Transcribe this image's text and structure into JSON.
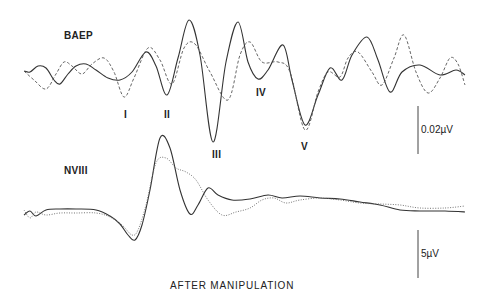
{
  "chart_data": [
    {
      "type": "line",
      "title": "BAEP",
      "xlabel": "",
      "ylabel": "",
      "grid": false,
      "legend": null,
      "scale_bar": "0.02µV",
      "peak_labels": [
        "I",
        "II",
        "III",
        "IV",
        "V"
      ],
      "series": [
        {
          "name": "solid",
          "style": "solid",
          "points": [
            [
              24,
              71
            ],
            [
              30,
              72
            ],
            [
              38,
              66
            ],
            [
              46,
              68
            ],
            [
              54,
              80
            ],
            [
              60,
              84
            ],
            [
              68,
              74
            ],
            [
              76,
              66
            ],
            [
              86,
              64
            ],
            [
              96,
              70
            ],
            [
              108,
              78
            ],
            [
              120,
              80
            ],
            [
              132,
              72
            ],
            [
              146,
              52
            ],
            [
              156,
              66
            ],
            [
              167,
              95
            ],
            [
              178,
              58
            ],
            [
              189,
              20
            ],
            [
              200,
              55
            ],
            [
              213,
              142
            ],
            [
              226,
              62
            ],
            [
              238,
              22
            ],
            [
              248,
              62
            ],
            [
              258,
              79
            ],
            [
              268,
              70
            ],
            [
              283,
              45
            ],
            [
              292,
              80
            ],
            [
              305,
              125
            ],
            [
              318,
              95
            ],
            [
              330,
              68
            ],
            [
              342,
              80
            ],
            [
              352,
              55
            ],
            [
              367,
              37
            ],
            [
              378,
              60
            ],
            [
              390,
              92
            ],
            [
              402,
              72
            ],
            [
              420,
              65
            ],
            [
              440,
              75
            ],
            [
              456,
              70
            ],
            [
              465,
              75
            ]
          ]
        },
        {
          "name": "dashed",
          "style": "dashed",
          "points": [
            [
              24,
              71
            ],
            [
              34,
              80
            ],
            [
              46,
              89
            ],
            [
              56,
              74
            ],
            [
              64,
              62
            ],
            [
              72,
              66
            ],
            [
              82,
              74
            ],
            [
              92,
              64
            ],
            [
              104,
              58
            ],
            [
              114,
              72
            ],
            [
              124,
              97
            ],
            [
              134,
              78
            ],
            [
              148,
              48
            ],
            [
              160,
              60
            ],
            [
              172,
              84
            ],
            [
              184,
              48
            ],
            [
              195,
              44
            ],
            [
              210,
              72
            ],
            [
              228,
              100
            ],
            [
              240,
              55
            ],
            [
              250,
              42
            ],
            [
              262,
              62
            ],
            [
              278,
              62
            ],
            [
              290,
              72
            ],
            [
              305,
              130
            ],
            [
              318,
              92
            ],
            [
              328,
              72
            ],
            [
              340,
              77
            ],
            [
              348,
              58
            ],
            [
              358,
              52
            ],
            [
              372,
              72
            ],
            [
              382,
              85
            ],
            [
              394,
              58
            ],
            [
              404,
              35
            ],
            [
              416,
              72
            ],
            [
              428,
              93
            ],
            [
              440,
              78
            ],
            [
              450,
              58
            ],
            [
              458,
              64
            ],
            [
              465,
              85
            ]
          ]
        }
      ]
    },
    {
      "type": "line",
      "title": "NVIII",
      "xlabel": "",
      "ylabel": "",
      "grid": false,
      "legend": null,
      "scale_bar": "5µV",
      "series": [
        {
          "name": "solid",
          "style": "solid",
          "points": [
            [
              24,
              215
            ],
            [
              30,
              211
            ],
            [
              36,
              216
            ],
            [
              46,
              210
            ],
            [
              60,
              209
            ],
            [
              76,
              209
            ],
            [
              96,
              210
            ],
            [
              110,
              216
            ],
            [
              120,
              224
            ],
            [
              128,
              235
            ],
            [
              135,
              240
            ],
            [
              142,
              225
            ],
            [
              150,
              190
            ],
            [
              160,
              138
            ],
            [
              170,
              148
            ],
            [
              180,
              190
            ],
            [
              190,
              214
            ],
            [
              198,
              205
            ],
            [
              208,
              188
            ],
            [
              218,
              195
            ],
            [
              232,
              200
            ],
            [
              250,
              199
            ],
            [
              268,
              195
            ],
            [
              282,
              198
            ],
            [
              300,
              196
            ],
            [
              320,
              198
            ],
            [
              340,
              199
            ],
            [
              360,
              202
            ],
            [
              380,
              205
            ],
            [
              400,
              210
            ],
            [
              420,
              211
            ],
            [
              445,
              211
            ],
            [
              465,
              212
            ]
          ]
        },
        {
          "name": "dotted",
          "style": "dotted",
          "points": [
            [
              24,
              210
            ],
            [
              30,
              218
            ],
            [
              36,
              212
            ],
            [
              46,
              215
            ],
            [
              60,
              213
            ],
            [
              76,
              213
            ],
            [
              96,
              213
            ],
            [
              110,
              217
            ],
            [
              122,
              225
            ],
            [
              132,
              235
            ],
            [
              138,
              230
            ],
            [
              146,
              205
            ],
            [
              156,
              163
            ],
            [
              166,
              158
            ],
            [
              176,
              168
            ],
            [
              186,
              172
            ],
            [
              196,
              180
            ],
            [
              208,
              200
            ],
            [
              222,
              215
            ],
            [
              236,
              212
            ],
            [
              250,
              208
            ],
            [
              262,
              200
            ],
            [
              274,
              198
            ],
            [
              286,
              203
            ],
            [
              300,
              200
            ],
            [
              320,
              198
            ],
            [
              340,
              200
            ],
            [
              360,
              203
            ],
            [
              380,
              204
            ],
            [
              400,
              205
            ],
            [
              420,
              208
            ],
            [
              445,
              208
            ],
            [
              465,
              206
            ]
          ]
        }
      ]
    }
  ],
  "labels": {
    "baep": "BAEP",
    "nviii": "NVIII",
    "peak_i": "I",
    "peak_ii": "II",
    "peak_iii": "III",
    "peak_iv": "IV",
    "peak_v": "V",
    "scale_top": "0.02µV",
    "scale_bottom": "5µV",
    "caption": "AFTER MANIPULATION"
  }
}
